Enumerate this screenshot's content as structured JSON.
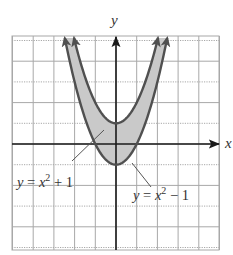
{
  "figure": {
    "axis_labels": {
      "x": "x",
      "y": "y"
    },
    "curves": [
      {
        "name": "upper",
        "equation": "y = x^2 + 1",
        "label_parts": [
          "y",
          " = ",
          "x",
          "2",
          " + 1"
        ],
        "vertex": [
          0,
          1
        ]
      },
      {
        "name": "lower",
        "equation": "y = x^2 - 1",
        "label_parts": [
          "y",
          " = ",
          "x",
          "2",
          " − 1"
        ],
        "vertex": [
          0,
          -1
        ]
      }
    ],
    "grid": {
      "x_range": [
        -5,
        5
      ],
      "y_range": [
        -5,
        5
      ],
      "step": 1
    },
    "colors": {
      "grid_line": "#a8a8a8",
      "axis": "#1a1a1a",
      "curve": "#505050",
      "shade": "#c9c9c9",
      "text": "#333333"
    }
  }
}
